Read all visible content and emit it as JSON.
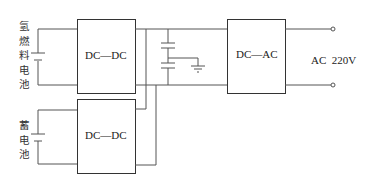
{
  "diagram": {
    "fuel_cell_label": [
      "氢",
      "燃",
      "料",
      "电",
      "池"
    ],
    "battery_label": [
      "蓄",
      "电",
      "池"
    ],
    "converter_top": "DC—DC",
    "converter_bottom": "DC—DC",
    "inverter": "DC—AC",
    "output": "AC  220V"
  }
}
